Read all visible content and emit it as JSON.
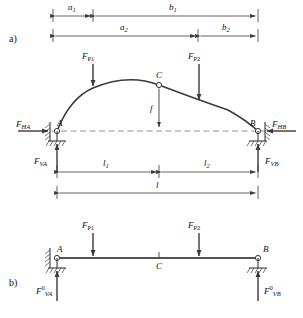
{
  "figure": {
    "parts": [
      {
        "key": "a",
        "label": "a)"
      },
      {
        "key": "b",
        "label": "b)"
      }
    ]
  },
  "dimensions": {
    "a1": {
      "symbol": "a",
      "sub": "1"
    },
    "b1": {
      "symbol": "b",
      "sub": "1"
    },
    "a2": {
      "symbol": "a",
      "sub": "2"
    },
    "b2": {
      "symbol": "b",
      "sub": "2"
    },
    "l1": {
      "symbol": "l",
      "sub": "1"
    },
    "l2": {
      "symbol": "l",
      "sub": "2"
    },
    "l": {
      "symbol": "l",
      "sub": ""
    },
    "f": {
      "symbol": "f",
      "sub": ""
    }
  },
  "arch": {
    "nodes": {
      "A": "A",
      "B": "B",
      "C": "C"
    },
    "loads": [
      {
        "name": "F_P1",
        "symbol": "F",
        "sub": "P1"
      },
      {
        "name": "F_P2",
        "symbol": "F",
        "sub": "P2"
      }
    ],
    "reactions": [
      {
        "name": "F_HA",
        "symbol": "F",
        "sub": "HA"
      },
      {
        "name": "F_HB",
        "symbol": "F",
        "sub": "HB"
      },
      {
        "name": "F_VA",
        "symbol": "F",
        "sub": "VA"
      },
      {
        "name": "F_VB",
        "symbol": "F",
        "sub": "VB"
      }
    ]
  },
  "beam": {
    "nodes": {
      "A": "A",
      "B": "B",
      "C": "C"
    },
    "loads": [
      {
        "name": "F_P1",
        "symbol": "F",
        "sub": "P1"
      },
      {
        "name": "F_P2",
        "symbol": "F",
        "sub": "P2"
      }
    ],
    "reactions": [
      {
        "name": "F0_VA",
        "symbol": "F",
        "sub": "VA",
        "sup": "0"
      },
      {
        "name": "F0_VB",
        "symbol": "F",
        "sub": "VB",
        "sup": "0"
      }
    ]
  },
  "colors": {
    "line": "#3a3a3a",
    "thick": "#555555",
    "dash": "#777777",
    "text": "#111111"
  }
}
